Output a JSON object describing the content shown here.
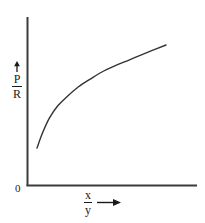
{
  "figure": {
    "background_color": "#ffffff",
    "ink_color": "#333333",
    "text_color": "#1a1a1a"
  },
  "chart_data": {
    "type": "line",
    "title": "",
    "subtitle": "",
    "xlabel": "x/y",
    "ylabel": "P/R",
    "xlabel_numerator": "x",
    "xlabel_denominator": "y",
    "ylabel_numerator": "P",
    "ylabel_denominator": "R",
    "origin_label": "0",
    "grid": false,
    "legend": null,
    "legend_position": "none",
    "axis_ticks": false,
    "tick_labels_x": [],
    "tick_labels_y": [],
    "xlim": [
      0,
      1
    ],
    "ylim": [
      0,
      1
    ],
    "annotations": [
      {
        "name": "y-axis-direction-arrow",
        "symbol": "up-arrow"
      },
      {
        "name": "x-axis-direction-arrow",
        "symbol": "right-arrow"
      }
    ],
    "series": [
      {
        "name": "P/R vs x/y",
        "color": "#333333",
        "style": "solid",
        "x": [
          0.06,
          0.1,
          0.15,
          0.21,
          0.28,
          0.36,
          0.45,
          0.55,
          0.66,
          0.78,
          0.9,
          1.0
        ],
        "y": [
          0.22,
          0.33,
          0.44,
          0.53,
          0.6,
          0.67,
          0.73,
          0.79,
          0.84,
          0.89,
          0.94,
          0.98
        ]
      }
    ]
  },
  "geometry": {
    "axis_origin_x": 27,
    "axis_origin_y": 185,
    "axis_top_y": 17,
    "axis_right_x": 197,
    "curve_start": {
      "x": 37,
      "y": 148
    },
    "curve_end": {
      "x": 166,
      "y": 45
    }
  }
}
